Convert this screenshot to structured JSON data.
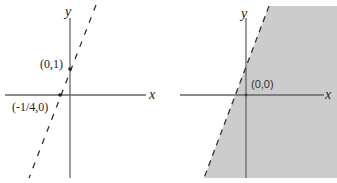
{
  "graphs": [
    {
      "id": "left",
      "description": "Dashed boundary line through intercepts, no shading",
      "x_axis_label": "x",
      "y_axis_label": "y",
      "points": [
        {
          "label": "(0,1)"
        },
        {
          "label": "(-1/4,0)"
        }
      ],
      "line_style": "dashed",
      "shaded": false
    },
    {
      "id": "right",
      "description": "Dashed boundary line with region to the right shaded (contains origin)",
      "x_axis_label": "x",
      "y_axis_label": "y",
      "test_point": {
        "label": "(0,0)"
      },
      "line_style": "dashed",
      "shaded": true,
      "shade_color": "#cccccc"
    }
  ],
  "colors": {
    "axis": "#555555",
    "line": "#333333",
    "shade": "#cccccc"
  }
}
